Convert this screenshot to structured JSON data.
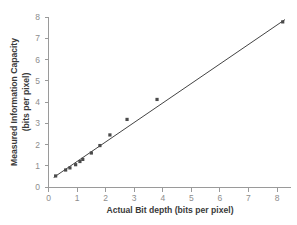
{
  "chart_data": {
    "type": "scatter",
    "title": "",
    "xlabel": "Actual Bit depth (bits per pixel)",
    "ylabel_line1": "Measured Information Capacity",
    "ylabel_line2": "(bits per pixel)",
    "xlim": [
      0,
      8.6
    ],
    "ylim": [
      0,
      8
    ],
    "grid": false,
    "legend": "none",
    "xticks": [
      "0",
      "1",
      "2",
      "3",
      "4",
      "5",
      "6",
      "7",
      "8"
    ],
    "xtick_values": [
      0,
      1,
      2,
      3,
      4,
      5,
      6,
      7,
      8
    ],
    "yticks": [
      "0",
      "1",
      "2",
      "3",
      "4",
      "5",
      "6",
      "7",
      "8"
    ],
    "ytick_values": [
      0,
      1,
      2,
      3,
      4,
      5,
      6,
      7,
      8
    ],
    "series": [
      {
        "name": "Measured information capacity",
        "marker": "square",
        "color": "#4a4a4a",
        "points": [
          [
            0.25,
            0.52
          ],
          [
            0.6,
            0.8
          ],
          [
            0.75,
            0.9
          ],
          [
            0.95,
            1.05
          ],
          [
            1.1,
            1.2
          ],
          [
            1.2,
            1.3
          ],
          [
            1.5,
            1.6
          ],
          [
            1.8,
            1.95
          ],
          [
            2.15,
            2.45
          ],
          [
            2.75,
            3.18
          ],
          [
            3.8,
            4.12
          ],
          [
            8.2,
            7.77
          ]
        ]
      }
    ],
    "trendline": {
      "name": "Linear fit",
      "color": "#2e2e2e",
      "x_start": 0.18,
      "y_start": 0.45,
      "x_end": 8.28,
      "y_end": 7.88
    },
    "colors": {
      "background": "#ffffff",
      "axis": "#9a9a9a",
      "tick_label": "#8d8d8d",
      "axis_title": "#3a3a3a",
      "marker": "#4a4a4a",
      "trendline": "#2e2e2e"
    }
  }
}
